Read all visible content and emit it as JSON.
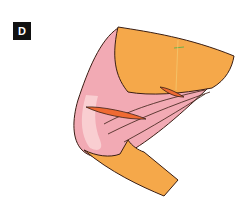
{
  "panel": {
    "label": "D"
  },
  "illustration": {
    "subject": "anatomical-bend-with-tissue-layers",
    "colors": {
      "outer_layer": "#f5a84a",
      "inner_tissue": "#f2aab4",
      "inner_tissue_light": "#f9d2d4",
      "slit": "#ef6a33",
      "outline": "#3a1e14",
      "accent_line": "#6fb04a"
    }
  }
}
